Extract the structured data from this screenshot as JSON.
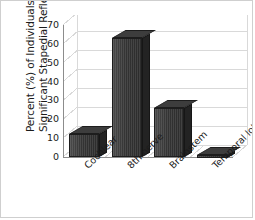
{
  "chart_data": {
    "type": "bar",
    "title": "",
    "xlabel": "",
    "ylabel": "Percent (%) of Individuals Showing Significant Stapedial Reflex Decay",
    "ylabel_line1": "Percent (%) of Individuals Showing",
    "ylabel_line2": "Significant Stapedial Reflex Decay",
    "categories": [
      "Cochlear",
      "8th nerve",
      "Brainstem",
      "Temporal lobe"
    ],
    "values": [
      12,
      63,
      26,
      1
    ],
    "ylim": [
      0,
      70
    ],
    "ytick_step": 10,
    "yticks": [
      "70",
      "60",
      "50",
      "40",
      "30",
      "20",
      "10",
      "0"
    ],
    "ytick_values": [
      70,
      60,
      50,
      40,
      30,
      20,
      10,
      0
    ],
    "grid": true,
    "legend": false,
    "style": "3d-column",
    "bar_color": "#333333",
    "grid_color": "#d9d9d9",
    "axis_color": "#8c8c8c",
    "text_color": "#1b1b1b"
  }
}
